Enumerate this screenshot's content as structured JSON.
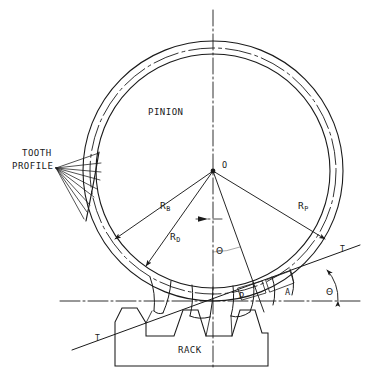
{
  "figure": {
    "background_color": "#ffffff",
    "line_color": "#1a1a1a"
  },
  "labels": {
    "pinion": "PINION",
    "rack": "RACK",
    "tooth_profile_line1": "TOOTH",
    "tooth_profile_line2": "PROFILE",
    "center_point": "O",
    "pitch_point": "P",
    "point_a": "A",
    "tangent_right": "T",
    "tangent_left": "T",
    "radius_base_main": "R",
    "radius_base_sub": "B",
    "radius_root_main": "R",
    "radius_root_sub": "D",
    "radius_pitch_main": "R",
    "radius_pitch_sub": "P",
    "angle_center": "Θ",
    "angle_right": "Θ"
  },
  "geometry": {
    "center": {
      "x": 213,
      "y": 171
    },
    "circles": [
      {
        "name": "outer-tip-circle",
        "r": 130
      },
      {
        "name": "pitch-circle",
        "r": 123
      },
      {
        "name": "base-circle",
        "r": 117
      }
    ],
    "pressure_angle_deg": 20,
    "pitch_line_y": 301,
    "rack": {
      "left": 115,
      "right": 268,
      "top": 307,
      "bottom": 366
    }
  }
}
